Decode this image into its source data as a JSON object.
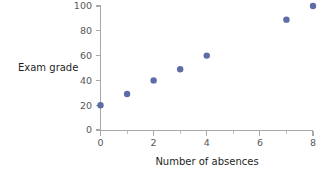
{
  "chart_data": {
    "type": "scatter",
    "title": "",
    "xlabel": "Number of absences",
    "ylabel": "Exam grade",
    "xlim": [
      0,
      8
    ],
    "ylim": [
      0,
      100
    ],
    "grid": false,
    "legend": "none",
    "marker_color": "#5d6ca6",
    "axis_color": "#a9a9a9",
    "x": [
      0,
      1,
      2,
      3,
      4,
      7,
      8
    ],
    "y": [
      20,
      29,
      40,
      49,
      60,
      89,
      100
    ],
    "points": [
      {
        "x": 0,
        "y": 20
      },
      {
        "x": 1,
        "y": 29
      },
      {
        "x": 2,
        "y": 40
      },
      {
        "x": 3,
        "y": 49
      },
      {
        "x": 4,
        "y": 60
      },
      {
        "x": 7,
        "y": 89
      },
      {
        "x": 8,
        "y": 100
      }
    ],
    "xticks": [
      {
        "value": 0,
        "label": "0"
      },
      {
        "value": 2,
        "label": "2"
      },
      {
        "value": 4,
        "label": "4"
      },
      {
        "value": 6,
        "label": "6"
      },
      {
        "value": 8,
        "label": "8"
      }
    ],
    "xticks_minor": [
      1,
      3,
      5,
      7
    ],
    "yticks": [
      {
        "value": 0,
        "label": "0"
      },
      {
        "value": 20,
        "label": "20"
      },
      {
        "value": 40,
        "label": "40"
      },
      {
        "value": 60,
        "label": "60"
      },
      {
        "value": 80,
        "label": "80"
      },
      {
        "value": 100,
        "label": "100"
      }
    ]
  }
}
